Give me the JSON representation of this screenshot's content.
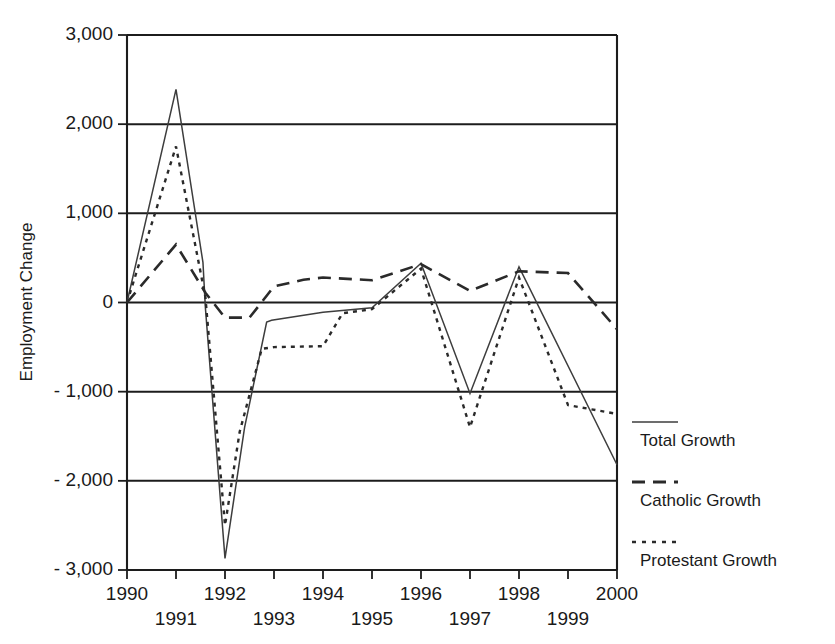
{
  "chart_data": {
    "type": "line",
    "title": "",
    "xlabel": "",
    "ylabel": "Employment Change",
    "xlim": [
      1990,
      2000
    ],
    "ylim": [
      -3000,
      3000
    ],
    "grid": true,
    "legend_position": "right",
    "x_tick_labels": [
      "1990",
      "1991",
      "1992",
      "1993",
      "1994",
      "1995",
      "1996",
      "1997",
      "1998",
      "1999",
      "2000"
    ],
    "x": [
      1990,
      1991,
      1992,
      2000
    ],
    "y_tick_labels": [
      "3,000",
      "2,000",
      "1,000",
      "0",
      "- 1,000",
      "- 2,000",
      "- 3,000"
    ],
    "y_ticks": [
      3000,
      2000,
      1000,
      0,
      -1000,
      -2000,
      -3000
    ],
    "series": [
      {
        "name": "Total Growth",
        "style": "solid",
        "points": [
          [
            1990.0,
            0
          ],
          [
            1991.0,
            2390
          ],
          [
            1991.55,
            450
          ],
          [
            1991.6,
            -60
          ],
          [
            1992.0,
            -2870
          ],
          [
            1992.4,
            -1400
          ],
          [
            1992.85,
            -220
          ],
          [
            1992.95,
            -200
          ],
          [
            1994.0,
            -110
          ],
          [
            1995.0,
            -60
          ],
          [
            1996.0,
            440
          ],
          [
            1997.0,
            -1020
          ],
          [
            1998.0,
            400
          ],
          [
            2000.0,
            -1820
          ]
        ]
      },
      {
        "name": "Catholic Growth",
        "style": "long-dash",
        "points": [
          [
            1990.0,
            0
          ],
          [
            1991.0,
            650
          ],
          [
            1991.6,
            110
          ],
          [
            1992.0,
            -170
          ],
          [
            1992.5,
            -170
          ],
          [
            1993.0,
            180
          ],
          [
            1993.6,
            255
          ],
          [
            1994.0,
            280
          ],
          [
            1995.0,
            250
          ],
          [
            1996.0,
            430
          ],
          [
            1997.0,
            130
          ],
          [
            1998.0,
            350
          ],
          [
            1999.0,
            330
          ],
          [
            2000.0,
            -300
          ]
        ]
      },
      {
        "name": "Protestant Growth",
        "style": "dotted",
        "points": [
          [
            1990.0,
            0
          ],
          [
            1991.0,
            1750
          ],
          [
            1991.6,
            60
          ],
          [
            1992.0,
            -2500
          ],
          [
            1992.3,
            -1450
          ],
          [
            1992.75,
            -520
          ],
          [
            1993.0,
            -500
          ],
          [
            1994.0,
            -490
          ],
          [
            1994.4,
            -120
          ],
          [
            1995.0,
            -75
          ],
          [
            1996.0,
            380
          ],
          [
            1997.0,
            -1400
          ],
          [
            1998.0,
            280
          ],
          [
            1999.0,
            -1150
          ],
          [
            2000.0,
            -1250
          ]
        ]
      }
    ]
  },
  "legend": {
    "items": [
      {
        "label": "Total Growth",
        "style": "solid"
      },
      {
        "label": "Catholic Growth",
        "style": "long-dash"
      },
      {
        "label": "Protestant Growth",
        "style": "dotted"
      }
    ]
  }
}
